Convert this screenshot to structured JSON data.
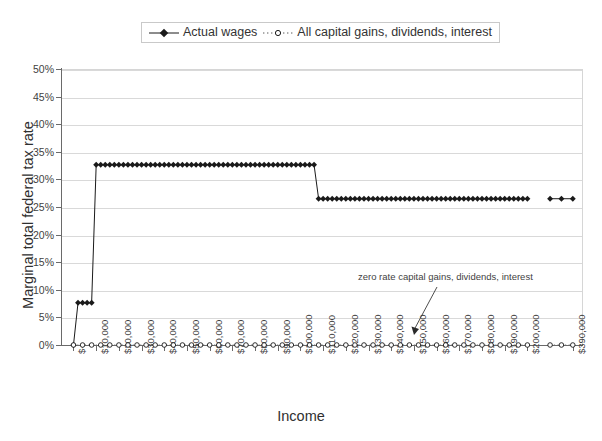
{
  "legend": {
    "position": "top-center",
    "entries": [
      {
        "label": "Actual wages",
        "marker": "filled-diamond-icon",
        "line": "solid",
        "color": "#1a1a1a"
      },
      {
        "label": "All capital gains, dividends, interest",
        "marker": "open-circle-icon",
        "line": "dotted",
        "color": "#1a1a1a"
      }
    ]
  },
  "axes": {
    "y_title": "Marginal total federal tax rate",
    "x_title": "Income",
    "y_ticks": [
      "0%",
      "5%",
      "10%",
      "15%",
      "20%",
      "25%",
      "30%",
      "35%",
      "40%",
      "45%",
      "50%"
    ],
    "x_ticks": [
      "$-",
      "$10,000",
      "$20,000",
      "$30,000",
      "$40,000",
      "$50,000",
      "$60,000",
      "$70,000",
      "$80,000",
      "$90,000",
      "$100,000",
      "$110,000",
      "$120,000",
      "$130,000",
      "$140,000",
      "$150,000",
      "$160,000",
      "$170,000",
      "$180,000",
      "$190,000",
      "$200,000",
      "$390,000"
    ]
  },
  "annotations": [
    {
      "text": "zero rate capital gains, dividends, interest",
      "arrow": "down-left-arrow-icon"
    }
  ],
  "chart_data": {
    "type": "line",
    "title": "",
    "xlabel": "Income",
    "ylabel": "Marginal total federal tax rate",
    "ylim": [
      0,
      50
    ],
    "ytick_values": [
      0,
      5,
      10,
      15,
      20,
      25,
      30,
      35,
      40,
      45,
      50
    ],
    "xtick_values": [
      0,
      10000,
      20000,
      30000,
      40000,
      50000,
      60000,
      70000,
      80000,
      90000,
      100000,
      110000,
      120000,
      130000,
      140000,
      150000,
      160000,
      170000,
      180000,
      190000,
      200000,
      390000
    ],
    "x_axis_break": {
      "after": 200000,
      "resumes_at": 390000
    },
    "grid": "horizontal",
    "legend_position": "top",
    "units": "percent",
    "series": [
      {
        "name": "Actual wages",
        "marker": "filled-diamond",
        "line_style": "solid",
        "x": [
          0,
          2000,
          4000,
          6000,
          8000,
          10000,
          12000,
          14000,
          16000,
          18000,
          20000,
          22000,
          24000,
          26000,
          28000,
          30000,
          32000,
          34000,
          36000,
          38000,
          40000,
          42000,
          44000,
          46000,
          48000,
          50000,
          52000,
          54000,
          56000,
          58000,
          60000,
          62000,
          64000,
          66000,
          68000,
          70000,
          72000,
          74000,
          76000,
          78000,
          80000,
          82000,
          84000,
          86000,
          88000,
          90000,
          92000,
          94000,
          96000,
          98000,
          100000,
          102000,
          104000,
          106000,
          108000,
          110000,
          112000,
          114000,
          116000,
          118000,
          120000,
          122000,
          124000,
          126000,
          128000,
          130000,
          132000,
          134000,
          136000,
          138000,
          140000,
          142000,
          144000,
          146000,
          148000,
          150000,
          152000,
          154000,
          156000,
          158000,
          160000,
          162000,
          164000,
          166000,
          168000,
          170000,
          172000,
          174000,
          176000,
          178000,
          180000,
          182000,
          184000,
          186000,
          188000,
          190000,
          192000,
          194000,
          196000,
          198000,
          200000,
          380000,
          385000,
          390000
        ],
        "y": [
          0,
          7.65,
          7.65,
          7.65,
          7.65,
          32.65,
          32.65,
          32.65,
          32.65,
          32.65,
          32.65,
          32.65,
          32.65,
          32.65,
          32.65,
          32.65,
          32.65,
          32.65,
          32.65,
          32.65,
          32.65,
          32.65,
          32.65,
          32.65,
          32.65,
          32.65,
          32.65,
          32.65,
          32.65,
          32.65,
          32.65,
          32.65,
          32.65,
          32.65,
          32.65,
          32.65,
          32.65,
          32.65,
          32.65,
          32.65,
          32.65,
          32.65,
          32.65,
          32.65,
          32.65,
          32.65,
          32.65,
          32.65,
          32.65,
          32.65,
          32.65,
          32.65,
          32.65,
          32.65,
          26.5,
          26.5,
          26.5,
          26.5,
          26.5,
          26.5,
          26.5,
          26.5,
          26.5,
          26.5,
          26.5,
          26.5,
          26.5,
          26.5,
          26.5,
          26.5,
          26.5,
          26.5,
          26.5,
          26.5,
          26.5,
          26.5,
          26.5,
          26.5,
          26.5,
          26.5,
          26.5,
          26.5,
          26.5,
          26.5,
          26.5,
          26.5,
          26.5,
          26.5,
          26.5,
          26.5,
          26.5,
          26.5,
          26.5,
          26.5,
          26.5,
          26.5,
          26.5,
          26.5,
          26.5,
          26.5,
          26.5,
          26.5,
          26.5,
          26.5
        ]
      },
      {
        "name": "All capital gains, dividends, interest",
        "marker": "open-circle",
        "line_style": "dotted",
        "constant_value": 0,
        "x": [
          0,
          4000,
          8000,
          12000,
          16000,
          20000,
          24000,
          28000,
          32000,
          36000,
          40000,
          44000,
          48000,
          52000,
          56000,
          60000,
          64000,
          68000,
          72000,
          76000,
          80000,
          84000,
          88000,
          92000,
          96000,
          100000,
          104000,
          108000,
          112000,
          116000,
          120000,
          124000,
          128000,
          132000,
          136000,
          140000,
          144000,
          148000,
          152000,
          156000,
          160000,
          164000,
          168000,
          172000,
          176000,
          180000,
          184000,
          188000,
          192000,
          196000,
          200000,
          380000,
          385000,
          390000
        ],
        "y": [
          0,
          0,
          0,
          0,
          0,
          0,
          0,
          0,
          0,
          0,
          0,
          0,
          0,
          0,
          0,
          0,
          0,
          0,
          0,
          0,
          0,
          0,
          0,
          0,
          0,
          0,
          0,
          0,
          0,
          0,
          0,
          0,
          0,
          0,
          0,
          0,
          0,
          0,
          0,
          0,
          0,
          0,
          0,
          0,
          0,
          0,
          0,
          0,
          0,
          0,
          0,
          0,
          0,
          0
        ]
      }
    ]
  }
}
